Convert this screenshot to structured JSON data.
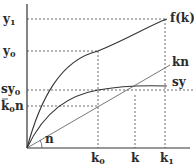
{
  "diagram": {
    "type": "solow-growth-model",
    "y_axis_labels": {
      "y1": "y",
      "y1_sub": "1",
      "y0": "y",
      "y0_sub": "0",
      "sy0": "sy",
      "sy0_sub": "0",
      "k0n_pre": "k",
      "k0n_sub": "0",
      "k0n_post": "n"
    },
    "x_axis_labels": {
      "k0": "k",
      "k0_sub": "0",
      "k": "k",
      "k1": "k",
      "k1_sub": "1"
    },
    "curve_labels": {
      "fk": "f(k)",
      "kn": "kn",
      "sy": "sy"
    },
    "angle_label": "n"
  }
}
